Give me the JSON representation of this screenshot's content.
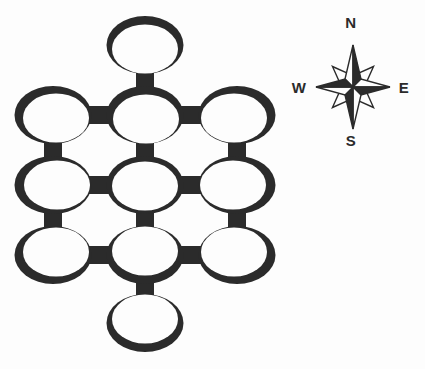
{
  "canvas": {
    "width": 425,
    "height": 369,
    "background": "#fdfdfd",
    "ink_color": "#2b2b2b",
    "paper_white": "#fdfdfd"
  },
  "ring_network": {
    "type": "linked-ring-diagram",
    "ring_count": 11,
    "geometry": {
      "outer_rx": 38.5,
      "outer_ry": 29,
      "inner_rx": 33,
      "inner_ry": 24.5,
      "link_thickness": 18
    },
    "rings": [
      {
        "id": "top",
        "cx": 145,
        "cy": 45,
        "shade_dx": 0,
        "shade_dy": 4
      },
      {
        "id": "nw",
        "cx": 53,
        "cy": 115,
        "shade_dx": 3,
        "shade_dy": 3
      },
      {
        "id": "n",
        "cx": 145,
        "cy": 115,
        "shade_dx": 1,
        "shade_dy": 4
      },
      {
        "id": "ne",
        "cx": 237,
        "cy": 115,
        "shade_dx": -3,
        "shade_dy": 3
      },
      {
        "id": "w",
        "cx": 53,
        "cy": 185,
        "shade_dx": 4,
        "shade_dy": 0
      },
      {
        "id": "center",
        "cx": 145,
        "cy": 185,
        "shade_dx": 0,
        "shade_dy": 1
      },
      {
        "id": "e",
        "cx": 237,
        "cy": 185,
        "shade_dx": -4,
        "shade_dy": 0
      },
      {
        "id": "sw",
        "cx": 53,
        "cy": 255,
        "shade_dx": 3,
        "shade_dy": -3
      },
      {
        "id": "s",
        "cx": 145,
        "cy": 255,
        "shade_dx": 0,
        "shade_dy": -4
      },
      {
        "id": "se",
        "cx": 237,
        "cy": 255,
        "shade_dx": -3,
        "shade_dy": -3
      },
      {
        "id": "bottom",
        "cx": 145,
        "cy": 323,
        "shade_dx": 0,
        "shade_dy": -4
      }
    ],
    "links": [
      [
        "top",
        "n"
      ],
      [
        "nw",
        "n"
      ],
      [
        "n",
        "ne"
      ],
      [
        "nw",
        "w"
      ],
      [
        "n",
        "center"
      ],
      [
        "ne",
        "e"
      ],
      [
        "w",
        "center"
      ],
      [
        "center",
        "e"
      ],
      [
        "w",
        "sw"
      ],
      [
        "center",
        "s"
      ],
      [
        "e",
        "se"
      ],
      [
        "sw",
        "s"
      ],
      [
        "s",
        "se"
      ],
      [
        "s",
        "bottom"
      ]
    ]
  },
  "compass": {
    "center_x": 353,
    "center_y": 87,
    "ns_arm_length": 42,
    "ew_arm_length": 37,
    "diagonal_arm_length": 29,
    "point_half_width": 8,
    "labels": {
      "north": {
        "text": "N",
        "x": 351,
        "y": 22
      },
      "west": {
        "text": "W",
        "x": 299,
        "y": 87
      },
      "east": {
        "text": "E",
        "x": 404,
        "y": 87
      },
      "south": {
        "text": "S",
        "x": 351,
        "y": 140
      }
    }
  }
}
